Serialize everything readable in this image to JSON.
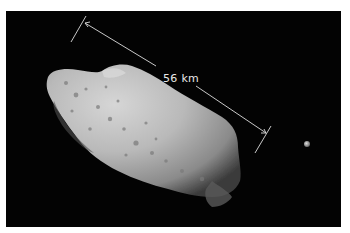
{
  "image": {
    "subject": "asteroid with small moon against black space",
    "background_color": "#030303",
    "border_color": "#ffffff"
  },
  "annotation": {
    "scale_label": "56 km",
    "line_color": "#e0e0e0"
  },
  "objects": [
    {
      "name": "asteroid",
      "description": "elongated cratered asteroid, lit from upper left"
    },
    {
      "name": "moon",
      "description": "small bright moonlet to the right"
    }
  ]
}
